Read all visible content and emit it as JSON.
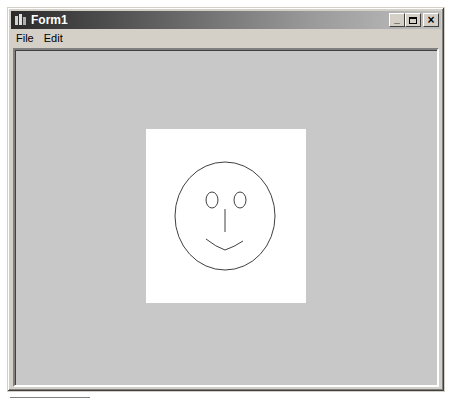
{
  "window": {
    "title": "Form1",
    "controls": {
      "minimize": "_",
      "maximize": "□",
      "close": "×"
    }
  },
  "menu": {
    "items": [
      {
        "label": "File"
      },
      {
        "label": "Edit"
      }
    ]
  },
  "canvas": {
    "background": "#ffffff",
    "drawing": "smiley-face",
    "stroke_color": "#404040"
  }
}
